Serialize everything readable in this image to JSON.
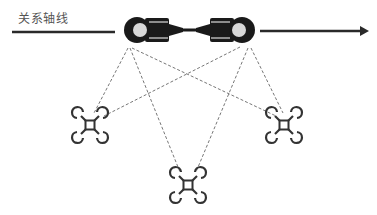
{
  "diagram": {
    "axis_label": "关系轴线",
    "colors": {
      "line": "#2a2a2a",
      "figure": "#1a1a1a",
      "head_fill": "#d8d8d8",
      "dashed": "#777777",
      "drone": "#333333",
      "background": "#ffffff"
    },
    "nodes": [
      {
        "id": "person-left",
        "type": "person-topdown",
        "facing": "right"
      },
      {
        "id": "person-right",
        "type": "person-topdown",
        "facing": "left"
      },
      {
        "id": "drone-left",
        "type": "quadcopter"
      },
      {
        "id": "drone-bottom",
        "type": "quadcopter"
      },
      {
        "id": "drone-right",
        "type": "quadcopter"
      }
    ],
    "edges": [
      {
        "from": "person-left",
        "to": "drone-left",
        "style": "dashed"
      },
      {
        "from": "person-left",
        "to": "drone-bottom",
        "style": "dashed"
      },
      {
        "from": "person-left",
        "to": "drone-right",
        "style": "dashed"
      },
      {
        "from": "person-right",
        "to": "drone-left",
        "style": "dashed"
      },
      {
        "from": "person-right",
        "to": "drone-bottom",
        "style": "dashed"
      },
      {
        "from": "person-right",
        "to": "drone-right",
        "style": "dashed"
      }
    ]
  }
}
